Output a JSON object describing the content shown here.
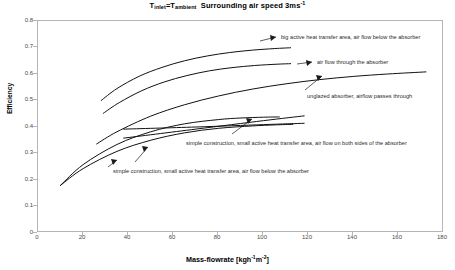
{
  "title": {
    "prefix_t": "T",
    "sub1": "inlet",
    "eq": "=T",
    "sub2": "ambient",
    "rest": "Surrounding air speed 3ms",
    "sup": "-1"
  },
  "axes": {
    "ylabel": "Efficiency",
    "xlabel_main": "Mass-flowrate [kgh",
    "xlabel_sup1": "-1",
    "xlabel_mid": "m",
    "xlabel_sup2": "-2",
    "xlabel_end": "]",
    "yticks": [
      "0.8",
      "0.7",
      "0.6",
      "0.5",
      "0.4",
      "0.3",
      "0.2",
      "0.1",
      "0"
    ],
    "xticks": [
      "0",
      "20",
      "40",
      "60",
      "80",
      "100",
      "120",
      "140",
      "160",
      "180"
    ]
  },
  "annotations": [
    {
      "id": "ann-big-active",
      "text": "big active heat transfer area, air flow below the absorber"
    },
    {
      "id": "ann-through-absorber",
      "text": "air flow through the absorber"
    },
    {
      "id": "ann-unglazed",
      "text": "unglazed absorber, airflow passes through"
    },
    {
      "id": "ann-both-sides",
      "text": "simple construction, small active heat transfer area, air flow on both sides of the absorber"
    },
    {
      "id": "ann-below-absorber",
      "text": "simple construction, small active heat transfer area, air flow below the absorber"
    }
  ],
  "chart_data": {
    "type": "line",
    "xlabel": "Mass-flowrate [kgh^-1 m^-2]",
    "ylabel": "Efficiency",
    "xlim": [
      0,
      180
    ],
    "ylim": [
      0,
      0.8
    ],
    "xticks": [
      0,
      20,
      40,
      60,
      80,
      100,
      120,
      140,
      160,
      180
    ],
    "yticks": [
      0,
      0.1,
      0.2,
      0.3,
      0.4,
      0.5,
      0.6,
      0.7,
      0.8
    ],
    "grid": false,
    "legend": "annotated-inline",
    "series": [
      {
        "name": "big active heat transfer area, air flow below the absorber",
        "x": [
          28,
          35,
          45,
          55,
          65,
          75,
          85,
          95,
          105,
          112
        ],
        "y": [
          0.5,
          0.545,
          0.592,
          0.625,
          0.65,
          0.668,
          0.681,
          0.69,
          0.696,
          0.699
        ]
      },
      {
        "name": "air flow through the absorber",
        "x": [
          29,
          36,
          46,
          56,
          66,
          76,
          86,
          96,
          106,
          112
        ],
        "y": [
          0.452,
          0.492,
          0.537,
          0.57,
          0.594,
          0.612,
          0.624,
          0.632,
          0.637,
          0.639
        ]
      },
      {
        "name": "unglazed absorber, airflow passes through",
        "x": [
          26,
          35,
          50,
          65,
          80,
          95,
          110,
          125,
          140,
          155,
          172
        ],
        "y": [
          0.336,
          0.382,
          0.441,
          0.484,
          0.517,
          0.543,
          0.563,
          0.579,
          0.591,
          0.6,
          0.608
        ]
      },
      {
        "name": "simple construction, small active heat transfer area, air flow on both sides of the absorber",
        "x": [
          10,
          20,
          35,
          50,
          65,
          80,
          90,
          100,
          107
        ],
        "y": [
          0.18,
          0.258,
          0.334,
          0.382,
          0.412,
          0.428,
          0.434,
          0.437,
          0.438
        ]
      },
      {
        "name": "simple construction, small active heat transfer area, air flow below the absorber",
        "x": [
          10,
          20,
          35,
          50,
          65,
          80,
          95,
          105,
          113
        ],
        "y": [
          0.18,
          0.243,
          0.308,
          0.35,
          0.378,
          0.395,
          0.404,
          0.408,
          0.41
        ]
      },
      {
        "name": "straight-line series A",
        "x": [
          38,
          70,
          100,
          118
        ],
        "y": [
          0.358,
          0.392,
          0.424,
          0.442
        ]
      },
      {
        "name": "straight-line series B",
        "x": [
          38,
          70,
          100,
          118
        ],
        "y": [
          0.392,
          0.4,
          0.409,
          0.414
        ]
      }
    ]
  }
}
